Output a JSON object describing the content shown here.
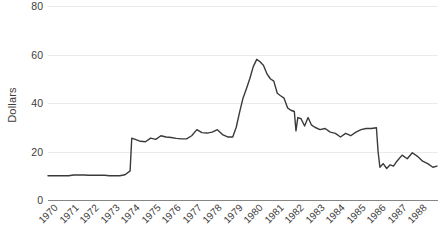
{
  "chart_data": {
    "type": "line",
    "title": "",
    "subtitle": "",
    "xlabel": "",
    "ylabel": "Dollars",
    "ylim": [
      0,
      80
    ],
    "yticks": [
      0,
      20,
      40,
      60,
      80
    ],
    "ytick_labels": [
      "0",
      "20",
      "40",
      "60",
      "80"
    ],
    "xlim": [
      1970,
      1989
    ],
    "xticks": [
      1970,
      1971,
      1972,
      1973,
      1974,
      1975,
      1976,
      1977,
      1978,
      1979,
      1980,
      1981,
      1982,
      1983,
      1984,
      1985,
      1986,
      1987,
      1988
    ],
    "xtick_labels": [
      "1970",
      "1971",
      "1972",
      "1973",
      "1974",
      "1975",
      "1976",
      "1977",
      "1978",
      "1979",
      "1980",
      "1981",
      "1982",
      "1983",
      "1984",
      "1985",
      "1986",
      "1987",
      "1988"
    ],
    "grid": "horizontal",
    "legend": "none",
    "line_color": "#3a3a38",
    "gridline_color": "#ebebeb",
    "axis_color": "#868684",
    "series": [
      {
        "name": "Dollars",
        "x": [
          1970.0,
          1970.25,
          1970.5,
          1970.75,
          1971.0,
          1971.25,
          1971.5,
          1971.75,
          1972.0,
          1972.25,
          1972.5,
          1972.75,
          1973.0,
          1973.25,
          1973.5,
          1973.75,
          1974.0,
          1974.08,
          1974.25,
          1974.5,
          1974.75,
          1975.0,
          1975.25,
          1975.5,
          1975.75,
          1976.0,
          1976.25,
          1976.5,
          1976.75,
          1977.0,
          1977.25,
          1977.5,
          1977.75,
          1978.0,
          1978.25,
          1978.5,
          1978.75,
          1979.0,
          1979.17,
          1979.33,
          1979.5,
          1979.67,
          1979.83,
          1980.0,
          1980.17,
          1980.33,
          1980.5,
          1980.67,
          1980.83,
          1981.0,
          1981.17,
          1981.33,
          1981.5,
          1981.67,
          1981.83,
          1982.0,
          1982.08,
          1982.17,
          1982.33,
          1982.5,
          1982.67,
          1982.83,
          1983.0,
          1983.25,
          1983.5,
          1983.75,
          1984.0,
          1984.25,
          1984.5,
          1984.75,
          1985.0,
          1985.25,
          1985.5,
          1985.75,
          1986.0,
          1986.08,
          1986.17,
          1986.33,
          1986.5,
          1986.67,
          1986.83,
          1987.0,
          1987.25,
          1987.5,
          1987.75,
          1988.0,
          1988.25,
          1988.5,
          1988.75,
          1988.95
        ],
        "values": [
          10.0,
          10.0,
          10.0,
          10.0,
          10.0,
          10.3,
          10.3,
          10.3,
          10.2,
          10.2,
          10.2,
          10.2,
          10.0,
          10.0,
          10.0,
          10.4,
          12.0,
          25.5,
          25.0,
          24.2,
          24.0,
          25.5,
          25.0,
          26.5,
          26.0,
          25.8,
          25.4,
          25.2,
          25.2,
          26.5,
          29.0,
          27.8,
          27.6,
          28.0,
          29.0,
          27.0,
          26.0,
          26.0,
          30.0,
          36.0,
          42.0,
          46.0,
          50.0,
          55.0,
          58.0,
          57.0,
          55.5,
          52.0,
          50.0,
          49.0,
          44.0,
          43.0,
          42.0,
          38.0,
          37.0,
          36.5,
          28.5,
          34.0,
          33.5,
          30.5,
          34.0,
          31.0,
          30.0,
          29.0,
          29.5,
          28.0,
          27.5,
          26.0,
          27.5,
          26.5,
          28.0,
          29.0,
          29.5,
          29.5,
          29.8,
          20.0,
          13.5,
          15.0,
          13.0,
          14.5,
          14.0,
          16.0,
          18.5,
          17.0,
          19.5,
          18.0,
          16.0,
          15.0,
          13.5,
          14.0
        ]
      }
    ]
  }
}
